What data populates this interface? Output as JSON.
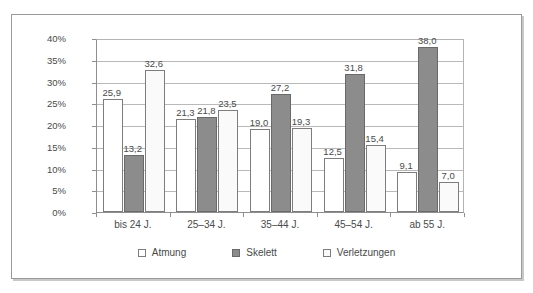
{
  "chart_data": {
    "type": "bar",
    "title": "",
    "subtitle": "",
    "xlabel": "",
    "ylabel": "",
    "categories": [
      "bis 24 J.",
      "25–34 J.",
      "35–44 J.",
      "45–54 J.",
      "ab 55 J."
    ],
    "series": [
      {
        "name": "Atmung",
        "color": "#ffffff",
        "values": [
          25.9,
          21.3,
          19.0,
          12.5,
          9.1
        ],
        "labels": [
          "25,9",
          "21,3",
          "19,0",
          "12,5",
          "9,1"
        ]
      },
      {
        "name": "Skelett",
        "color": "#8c8c8c",
        "values": [
          13.2,
          21.8,
          27.2,
          31.8,
          38.0
        ],
        "labels": [
          "13,2",
          "21,8",
          "27,2",
          "31,8",
          "38,0"
        ]
      },
      {
        "name": "Verletzungen",
        "color": "#fafafa",
        "values": [
          32.6,
          23.5,
          19.3,
          15.4,
          7.0
        ],
        "labels": [
          "32,6",
          "23,5",
          "19,3",
          "15,4",
          "7,0"
        ]
      }
    ],
    "ylim": [
      0,
      40
    ],
    "ytick_values": [
      0,
      5,
      10,
      15,
      20,
      25,
      30,
      35,
      40
    ],
    "ytick_labels": [
      "0%",
      "5%",
      "10%",
      "15%",
      "20%",
      "25%",
      "30%",
      "35%",
      "40%"
    ],
    "grid": true,
    "legend_position": "bottom",
    "legend_entries": [
      "Atmung",
      "Skelett",
      "Verletzungen"
    ]
  }
}
